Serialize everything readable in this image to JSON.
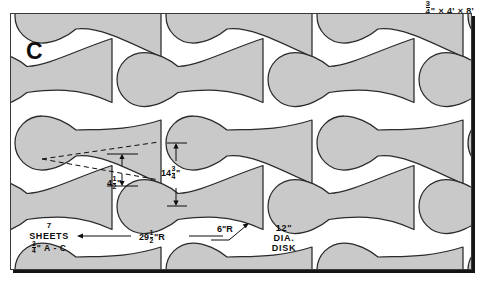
{
  "header": {
    "thickness": "3/4\"",
    "times1": "×",
    "width": "4'",
    "times2": "×",
    "length": "8'",
    "full": "3/4\" × 4' × 8'"
  },
  "sheet": {
    "part_letter": "C",
    "quantity_note": {
      "count": "7",
      "unit": "SHEETS",
      "thickness_num": "3",
      "thickness_den": "4",
      "thickness_mark": "\"",
      "grade": "A - C",
      "full": "7 SHEETS 3/4\" A-C"
    },
    "disk_note": {
      "size": "12\"",
      "line2": "DIA.",
      "line3": "DISK",
      "full": "12\" DIA. DISK"
    }
  },
  "dimensions": [
    {
      "id": "waist-width",
      "whole": "4",
      "num": "1",
      "den": "2",
      "unit": "\"",
      "full": "4 1/2\""
    },
    {
      "id": "flare-height",
      "whole": "14",
      "num": "3",
      "den": "4",
      "unit": "\"",
      "full": "14 3/4\""
    },
    {
      "id": "large-radius",
      "whole": "29",
      "num": "1",
      "den": "2",
      "unit": "\"R",
      "full": "29 1/2\"R"
    },
    {
      "id": "fillet-radius",
      "whole": "6",
      "num": "",
      "den": "",
      "unit": "\"R",
      "full": "6\"R"
    }
  ],
  "colors": {
    "part_fill": "#c9c9c9",
    "part_stroke": "#2b2b2b",
    "sheet_bg": "#ffffff",
    "frame": "#3a3a3a",
    "shadow": "#141414",
    "ink": "#0d0d0d"
  },
  "chart_data": {
    "type": "diagram",
    "stock": "3/4\" × 4' × 8' A-C plywood",
    "sheets_required": 7,
    "disk_sander": "12\" DIA. DISK",
    "part_label": "C",
    "rows": 4,
    "parts_per_row": 3,
    "callouts": [
      "4 1/2\"",
      "14 3/4\"",
      "29 1/2\"R",
      "6\"R"
    ]
  }
}
